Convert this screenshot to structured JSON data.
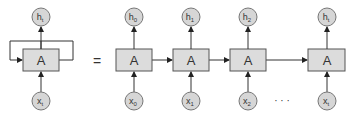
{
  "diagram": {
    "equals": "=",
    "ellipsis": "· · ·",
    "folded": {
      "cell": "A",
      "output": {
        "base": "h",
        "sub": "t"
      },
      "input": {
        "base": "x",
        "sub": "t"
      }
    },
    "unrolled": [
      {
        "cell": "A",
        "output": {
          "base": "h",
          "sub": "0"
        },
        "input": {
          "base": "x",
          "sub": "0"
        }
      },
      {
        "cell": "A",
        "output": {
          "base": "h",
          "sub": "1"
        },
        "input": {
          "base": "x",
          "sub": "1"
        }
      },
      {
        "cell": "A",
        "output": {
          "base": "h",
          "sub": "2"
        },
        "input": {
          "base": "x",
          "sub": "2"
        }
      },
      {
        "cell": "A",
        "output": {
          "base": "h",
          "sub": "t"
        },
        "input": {
          "base": "x",
          "sub": "t"
        }
      }
    ]
  }
}
